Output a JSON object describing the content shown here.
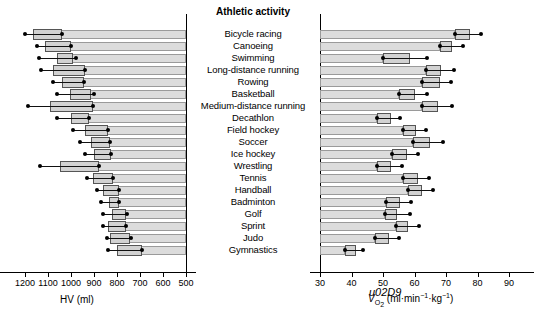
{
  "center": {
    "title": "Athletic activity"
  },
  "left_axis": {
    "title": "HV (ml)",
    "ticks": [
      1200,
      1100,
      1000,
      900,
      800,
      700,
      600,
      500
    ],
    "min": 500,
    "max": 1200,
    "reversed": true
  },
  "right_axis": {
    "title_main": "V",
    "title_sub": "O",
    "title_sub2": "2",
    "title_units": " (ml·min",
    "title_sup1": "−1",
    "title_mid": "·kg",
    "title_sup2": "−1",
    "title_close": ")",
    "ticks": [
      30,
      40,
      50,
      60,
      70,
      80,
      90
    ],
    "min": 30,
    "max": 90,
    "reversed": false
  },
  "chart_data": {
    "type": "bar",
    "title": "Athletic activity",
    "orientation": "horizontal",
    "layout": "back-to-back paired panels with mean bar, SD box and range whisker",
    "categories": [
      "Bicycle racing",
      "Canoeing",
      "Swimming",
      "Long-distance running",
      "Rowing",
      "Basketball",
      "Medium-distance running",
      "Decathlon",
      "Field hockey",
      "Soccer",
      "Ice hockey",
      "Wrestling",
      "Tennis",
      "Handball",
      "Badminton",
      "Golf",
      "Sprint",
      "Judo",
      "Gymnastics"
    ],
    "series": [
      {
        "name": "HV (ml)",
        "panel": "left",
        "xlabel": "HV (ml)",
        "xlim": [
          1200,
          500
        ],
        "values": [
          1104,
          1064,
          1022,
          1010,
          1000,
          960,
          985,
          960,
          890,
          870,
          862,
          975,
          860,
          820,
          810,
          790,
          800,
          790,
          750
        ],
        "sd_low": [
          1165,
          1115,
          1060,
          1080,
          1040,
          1005,
          1090,
          1000,
          940,
          915,
          900,
          1050,
          905,
          862,
          835,
          822,
          840,
          830,
          800
        ],
        "sd_high": [
          1040,
          1000,
          990,
          940,
          945,
          915,
          905,
          920,
          840,
          830,
          825,
          880,
          818,
          790,
          790,
          760,
          762,
          745,
          690
        ],
        "range_low": [
          1200,
          1150,
          1140,
          1130,
          1080,
          1060,
          1185,
          1060,
          990,
          960,
          940,
          1135,
          930,
          885,
          870,
          860,
          862,
          845,
          840
        ],
        "range_high": [
          1040,
          1000,
          980,
          940,
          945,
          900,
          905,
          920,
          840,
          830,
          825,
          880,
          818,
          790,
          790,
          755,
          762,
          740,
          690
        ]
      },
      {
        "name": "VO2 (ml·min−1·kg−1)",
        "panel": "right",
        "xlabel": "VO2 (ml·min−1·kg−1)",
        "xlim": [
          30,
          90
        ],
        "values": [
          73.0,
          68.0,
          50.0,
          63.5,
          62.5,
          55.0,
          62.5,
          48.0,
          56.5,
          59.5,
          53.0,
          48.0,
          56.5,
          58.0,
          51.0,
          50.5,
          54.0,
          47.5,
          38.0
        ],
        "sd_low": [
          73.0,
          68.0,
          50.0,
          63.5,
          62.5,
          55.0,
          62.5,
          48.0,
          56.5,
          59.5,
          53.0,
          48.0,
          56.5,
          58.0,
          51.0,
          50.5,
          54.0,
          47.5,
          38.0
        ],
        "sd_high": [
          77.5,
          72.0,
          58.5,
          68.5,
          68.0,
          60.0,
          67.5,
          52.5,
          60.5,
          65.0,
          57.5,
          52.5,
          61.0,
          62.5,
          55.5,
          54.5,
          58.0,
          52.0,
          41.5
        ],
        "range_low": [
          73.0,
          68.0,
          50.0,
          63.5,
          62.5,
          55.0,
          62.5,
          48.0,
          56.5,
          59.5,
          53.0,
          48.0,
          56.5,
          58.0,
          51.0,
          50.5,
          54.0,
          47.5,
          38.0
        ],
        "range_high": [
          81.0,
          75.5,
          64.0,
          72.5,
          71.5,
          64.0,
          72.0,
          55.5,
          63.5,
          69.0,
          61.0,
          56.0,
          64.5,
          66.0,
          59.0,
          58.5,
          61.5,
          55.0,
          43.5
        ]
      }
    ],
    "grid": false,
    "legend": "none"
  }
}
